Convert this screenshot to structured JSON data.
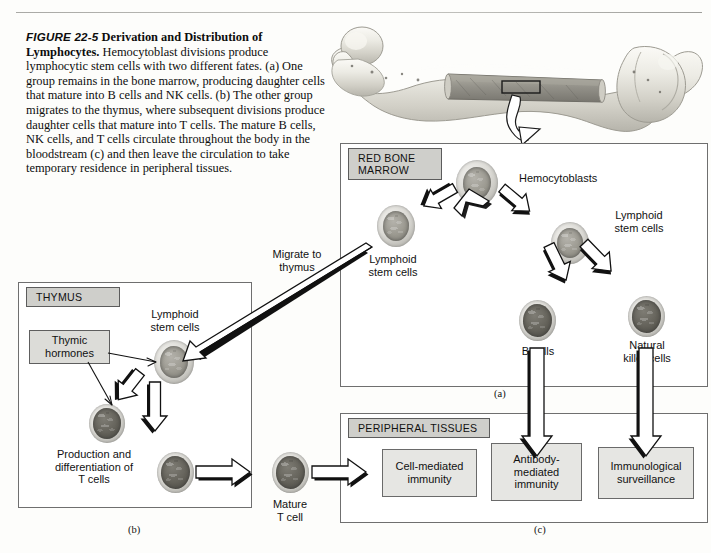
{
  "figure": {
    "number": "FIGURE 22-5",
    "title": "Derivation and Distribution of Lymphocytes.",
    "caption_body": "Hemocytoblast divisions produce lymphocytic stem cells with two different fates. (a) One group remains in the bone marrow, producing daughter cells that mature into B cells and NK cells. (b) The other group migrates to the thymus, where subsequent divisions produce daughter cells that mature into T cells. The mature B cells, NK cells, and T cells circulate throughout the body in the bloodstream (c) and then leave the circulation to take temporary residence in peripheral tissues."
  },
  "bone": {
    "name": "femur-illustration",
    "callout_arrow": "curved-arrow-down"
  },
  "panels": {
    "marrow": {
      "tag": "RED BONE\nMARROW",
      "letter": "(a)"
    },
    "thymus": {
      "tag": "THYMUS",
      "letter": "(b)"
    },
    "peripheral": {
      "tag": "PERIPHERAL TISSUES",
      "letter": "(c)"
    }
  },
  "marrow_labels": {
    "hemocytoblasts": "Hemocytoblasts",
    "lymphoid_stem_left": "Lymphoid\nstem cells",
    "lymphoid_stem_right": "Lymphoid\nstem cells",
    "b_cells": "B cells",
    "nk_cells": "Natural\nkiller cells"
  },
  "thymus_labels": {
    "lymphoid_stem": "Lymphoid\nstem cells",
    "thymic_hormones": "Thymic\nhormones",
    "production": "Production and\ndifferentiation of\nT cells",
    "mature_t_cell": "Mature\nT cell"
  },
  "migration": {
    "label": "Migrate to\nthymus"
  },
  "outcomes": [
    {
      "name": "cell-mediated-immunity",
      "label": "Cell-mediated\nimmunity"
    },
    {
      "name": "antibody-mediated-immunity",
      "label": "Antibody-\nmediated\nimmunity"
    },
    {
      "name": "immunological-surveillance",
      "label": "Immunological\nsurveillance"
    }
  ],
  "colors": {
    "panel_border": "#6f6f6f",
    "tag_fill": "#cfcfcb",
    "box_fill": "#e6e6e3",
    "arrow_fill": "#ffffff",
    "arrow_stroke": "#111111",
    "shadow": "#111111"
  }
}
